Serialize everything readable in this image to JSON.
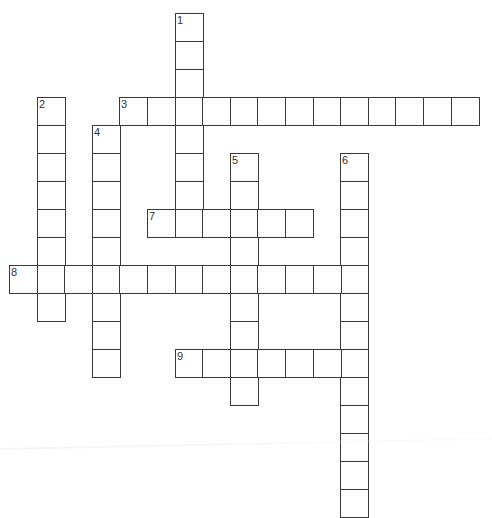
{
  "puzzle": {
    "type": "crossword",
    "cell_size": {
      "w": 27.6,
      "h": 28
    },
    "origin": {
      "x": 9,
      "y": 13
    },
    "colors": {
      "border": "#3a3a3a",
      "cell_fill": "#ffffff",
      "number": "#333333",
      "background": "#ffffff"
    },
    "entries": [
      {
        "number": "1",
        "direction": "down",
        "row": 0,
        "col": 6,
        "length": 8
      },
      {
        "number": "2",
        "direction": "down",
        "row": 3,
        "col": 1,
        "length": 8
      },
      {
        "number": "3",
        "direction": "across",
        "row": 3,
        "col": 4,
        "length": 13
      },
      {
        "number": "4",
        "direction": "down",
        "row": 4,
        "col": 3,
        "length": 9
      },
      {
        "number": "5",
        "direction": "down",
        "row": 5,
        "col": 8,
        "length": 9
      },
      {
        "number": "6",
        "direction": "down",
        "row": 5,
        "col": 12,
        "length": 13
      },
      {
        "number": "7",
        "direction": "across",
        "row": 7,
        "col": 5,
        "length": 6
      },
      {
        "number": "8",
        "direction": "across",
        "row": 9,
        "col": 0,
        "length": 13
      },
      {
        "number": "9",
        "direction": "across",
        "row": 12,
        "col": 6,
        "length": 7
      }
    ]
  }
}
